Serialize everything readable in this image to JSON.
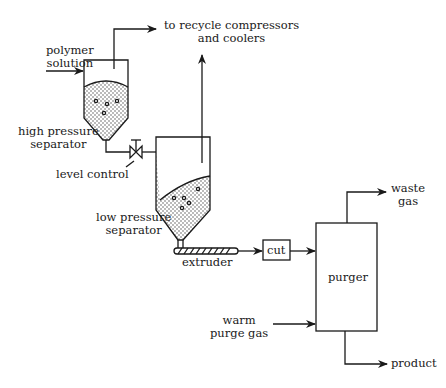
{
  "diagram": {
    "type": "process-flow",
    "labels": {
      "polymer_solution": [
        "polymer",
        "solution"
      ],
      "recycle": [
        "to recycle compressors",
        "and coolers"
      ],
      "high_pressure_separator": [
        "high pressure",
        "separator"
      ],
      "level_control": "level control",
      "low_pressure_separator": [
        "low pressure",
        "separator"
      ],
      "extruder": "extruder",
      "cut": "cut",
      "purger": "purger",
      "waste_gas": [
        "waste",
        "gas"
      ],
      "warm_purge_gas": [
        "warm",
        "purge gas"
      ],
      "product": "product"
    },
    "colors": {
      "stroke": "#1a1a1a",
      "fill": "#ffffff",
      "stipple": "#555555"
    }
  }
}
